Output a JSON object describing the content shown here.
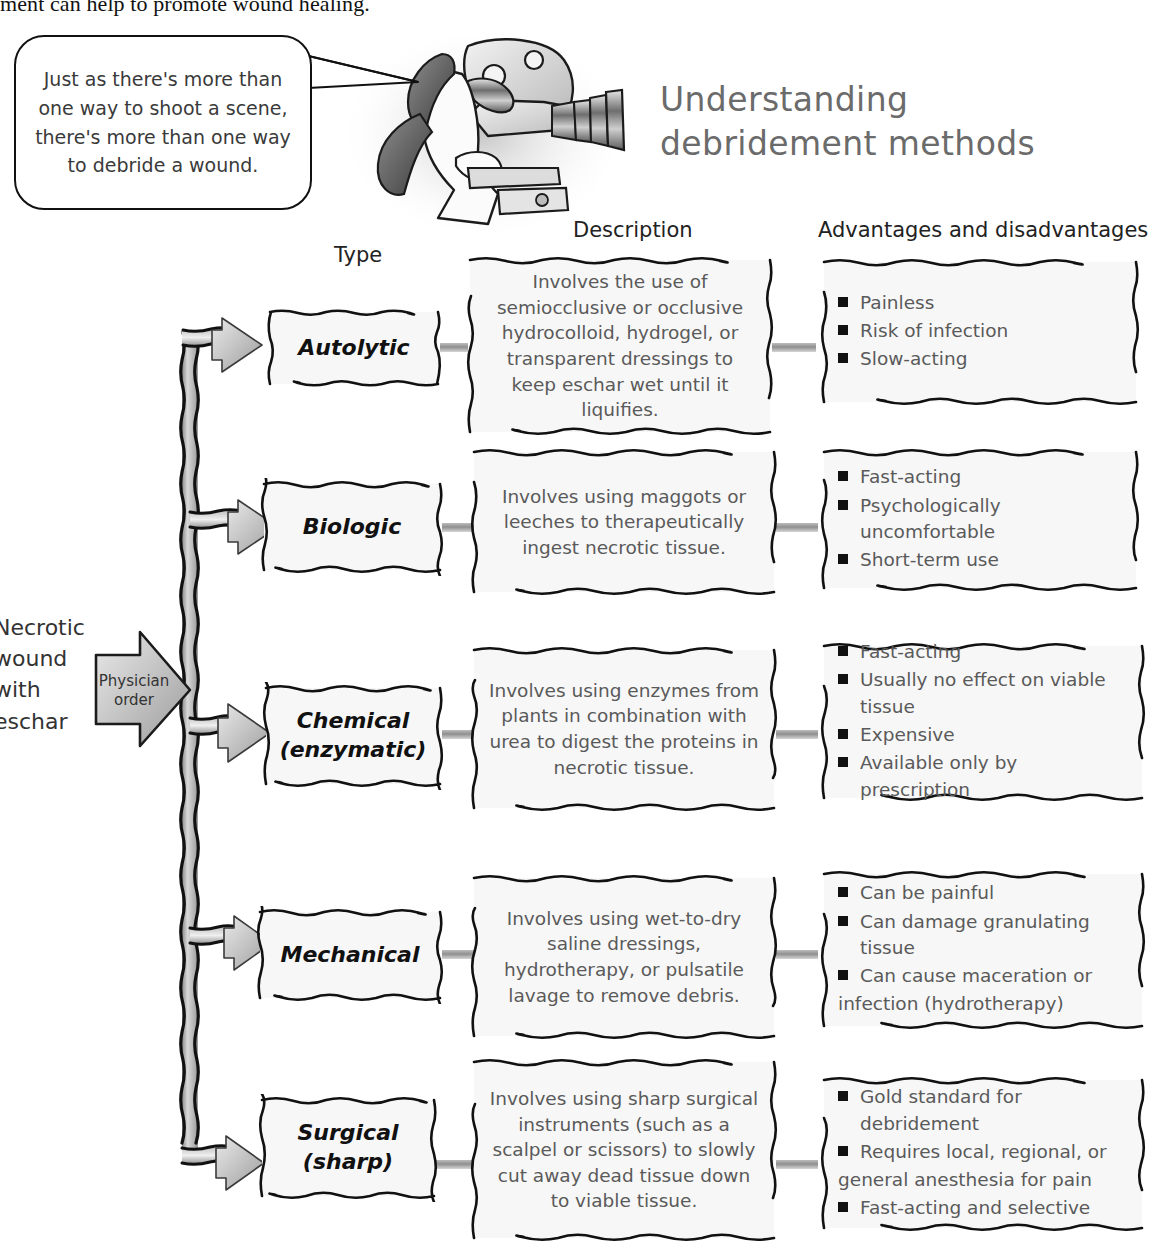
{
  "top_text": "ment can help to promote wound healing.",
  "balloon": {
    "text": "Just as there's more than one way to shoot a scene, there's more than one way to debride a wound."
  },
  "title": {
    "line1": "Understanding",
    "line2": "debridement methods"
  },
  "headers": {
    "type": "Type",
    "description": "Description",
    "advantages": "Advantages and disadvantages"
  },
  "source": {
    "label": "Necrotic wound with eschar",
    "gate": "Physician order"
  },
  "illustration": {
    "name": "camera-operator-illustration"
  },
  "rows": [
    {
      "type": "Autolytic",
      "type_sub": "",
      "description": "Involves the use of semiocclusive or occlusive hydrocolloid, hydrogel, or transparent dressings to keep eschar wet until it liquifies.",
      "points": [
        {
          "text": "Painless",
          "bullet": true
        },
        {
          "text": "Risk of infection",
          "bullet": true
        },
        {
          "text": "Slow-acting",
          "bullet": true
        }
      ]
    },
    {
      "type": "Biologic",
      "type_sub": "",
      "description": "Involves using maggots or leeches to therapeutically ingest necrotic tissue.",
      "points": [
        {
          "text": "Fast-acting",
          "bullet": true
        },
        {
          "text": "Psychologically uncomfortable",
          "bullet": true
        },
        {
          "text": "Short-term use",
          "bullet": true
        }
      ]
    },
    {
      "type": "Chemical",
      "type_sub": "(enzymatic)",
      "description": "Involves using enzymes from plants in combination with urea to digest the proteins in necrotic tissue.",
      "points": [
        {
          "text": "Fast-acting",
          "bullet": true
        },
        {
          "text": "Usually no effect on viable tissue",
          "bullet": true
        },
        {
          "text": "Expensive",
          "bullet": true
        },
        {
          "text": "Available only by prescription",
          "bullet": true
        }
      ]
    },
    {
      "type": "Mechanical",
      "type_sub": "",
      "description": "Involves using wet-to-dry saline dressings, hydrotherapy, or pulsatile lavage to remove debris.",
      "points": [
        {
          "text": "Can be painful",
          "bullet": true
        },
        {
          "text": "Can damage granulating tissue",
          "bullet": true
        },
        {
          "text": "Can cause maceration or",
          "bullet": true
        },
        {
          "text": "infection (hydrotherapy)",
          "bullet": false
        }
      ]
    },
    {
      "type": "Surgical",
      "type_sub": "(sharp)",
      "description": "Involves using sharp surgical instruments (such as a scalpel or scissors) to slowly cut away dead tissue down to viable tissue.",
      "points": [
        {
          "text": "Gold standard for debridement",
          "bullet": true
        },
        {
          "text": "Requires local, regional, or",
          "bullet": true
        },
        {
          "text": "general anesthesia for pain",
          "bullet": false
        },
        {
          "text": "Fast-acting and selective",
          "bullet": true
        }
      ]
    }
  ],
  "colors": {
    "ink": "#111111",
    "body_text": "#5a5a5a",
    "title": "#6b6b6b",
    "box_fill": "#f7f7f7",
    "arrow_gray": "#b5b5b5"
  }
}
